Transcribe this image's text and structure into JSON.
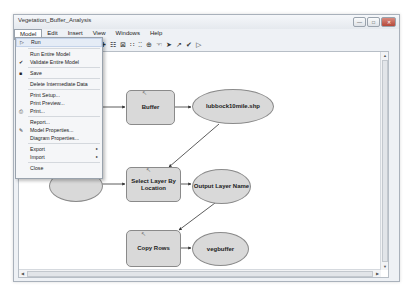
{
  "window": {
    "title": "Vegetation_Buffer_Analysis",
    "title_icon": "model-icon",
    "buttons": {
      "minimize": "—",
      "maximize": "□",
      "close": "✕"
    }
  },
  "menubar": {
    "items": [
      {
        "label": "Model",
        "open": true
      },
      {
        "label": "Edit"
      },
      {
        "label": "Insert"
      },
      {
        "label": "View"
      },
      {
        "label": "Windows"
      },
      {
        "label": "Help"
      }
    ]
  },
  "toolbar": {
    "icons": [
      "add-data-icon",
      "auto-layout-icon",
      "full-extent-icon",
      "fixed-zoom-in-icon",
      "fixed-zoom-out-icon",
      "zoom-in-icon",
      "pan-icon",
      "select-icon",
      "connect-icon",
      "validate-icon",
      "run-icon"
    ],
    "glyphs": [
      "✚",
      "☷",
      "⊠",
      "∷",
      "⁚⁚",
      "⊕",
      "☜",
      "➤",
      "↗",
      "✔",
      "▷"
    ]
  },
  "model_menu": {
    "items": [
      {
        "label": "Run",
        "icon": "▷",
        "highlighted": true
      },
      {
        "label": "Run Entire Model"
      },
      {
        "label": "Validate Entire Model",
        "icon": "✔"
      },
      {
        "label": "Save",
        "icon": "■"
      },
      {
        "label": "Delete Intermediate Data"
      },
      {
        "label": "Print Setup..."
      },
      {
        "label": "Print Preview..."
      },
      {
        "label": "Print...",
        "icon": "⎙"
      },
      {
        "label": "Report..."
      },
      {
        "label": "Model Properties...",
        "icon": "✎"
      },
      {
        "label": "Diagram Properties..."
      },
      {
        "label": "Export",
        "submenu": "▸"
      },
      {
        "label": "Import",
        "submenu": "▸"
      },
      {
        "label": "Close"
      }
    ]
  },
  "diagram": {
    "processes": [
      {
        "id": "buffer",
        "label": "Buffer"
      },
      {
        "id": "select",
        "label": "Select Layer By Location"
      },
      {
        "id": "copy",
        "label": "Copy Rows"
      }
    ],
    "data": [
      {
        "id": "lubbock",
        "label": "lubbock10mile.shp"
      },
      {
        "id": "output",
        "label": "Output Layer Name"
      },
      {
        "id": "vegbuffer",
        "label": "vegbuffer"
      }
    ],
    "colors": {
      "fill": "#d9d9d9",
      "stroke": "#8a8a8a",
      "line": "#333333"
    }
  },
  "scroll": {
    "up": "▲",
    "down": "▼",
    "left": "◀",
    "right": "▶"
  }
}
